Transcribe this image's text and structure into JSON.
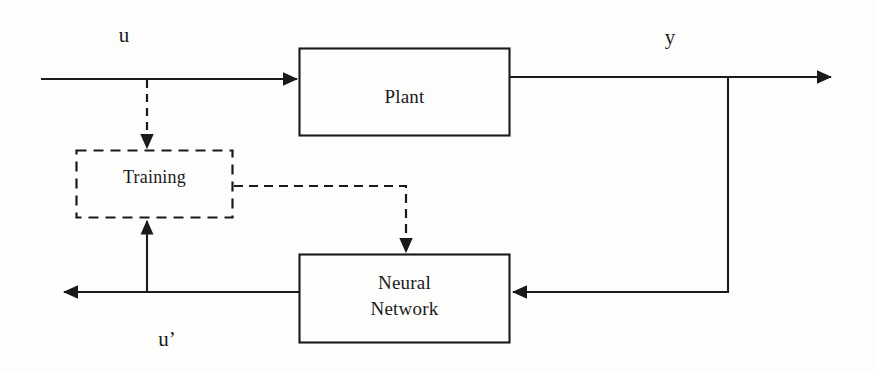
{
  "diagram": {
    "type": "control-block-diagram",
    "canvas": {
      "width": 875,
      "height": 373
    },
    "colors": {
      "background": "#fdfdfc",
      "stroke": "#1a1a1a",
      "text": "#1a1a1a"
    },
    "blocks": [
      {
        "id": "plant",
        "label": "Plant",
        "style": "solid",
        "x": 299,
        "y": 48,
        "width": 211,
        "height": 88
      },
      {
        "id": "neural-network",
        "label": "Neural\nNetwork",
        "style": "solid",
        "x": 299,
        "y": 254,
        "width": 211,
        "height": 89
      },
      {
        "id": "training",
        "label": "Training",
        "style": "dashed",
        "x": 76,
        "y": 150,
        "width": 157,
        "height": 68
      }
    ],
    "signals": [
      {
        "id": "u",
        "label": "u",
        "x": 124,
        "y": 36
      },
      {
        "id": "y",
        "label": "y",
        "x": 670,
        "y": 38
      },
      {
        "id": "u-prime",
        "label": "u’",
        "x": 167,
        "y": 340
      }
    ],
    "connections": [
      {
        "id": "u-to-plant",
        "from": "input-u",
        "to": "plant",
        "style": "solid",
        "arrow": true
      },
      {
        "id": "u-branch-to-training",
        "from": "u-line",
        "to": "training",
        "style": "dashed",
        "arrow": true
      },
      {
        "id": "plant-to-y",
        "from": "plant",
        "to": "output-y",
        "style": "solid",
        "arrow": true
      },
      {
        "id": "training-to-nn",
        "from": "training",
        "to": "neural-network",
        "style": "dashed",
        "arrow": true
      },
      {
        "id": "y-feedback-to-nn",
        "from": "y-line",
        "to": "neural-network",
        "style": "solid",
        "arrow": true
      },
      {
        "id": "nn-to-uprime",
        "from": "neural-network",
        "to": "output-u-prime",
        "style": "solid",
        "arrow": true
      },
      {
        "id": "uprime-branch-to-training",
        "from": "u-prime-line",
        "to": "training",
        "style": "solid",
        "arrow": true
      }
    ]
  }
}
